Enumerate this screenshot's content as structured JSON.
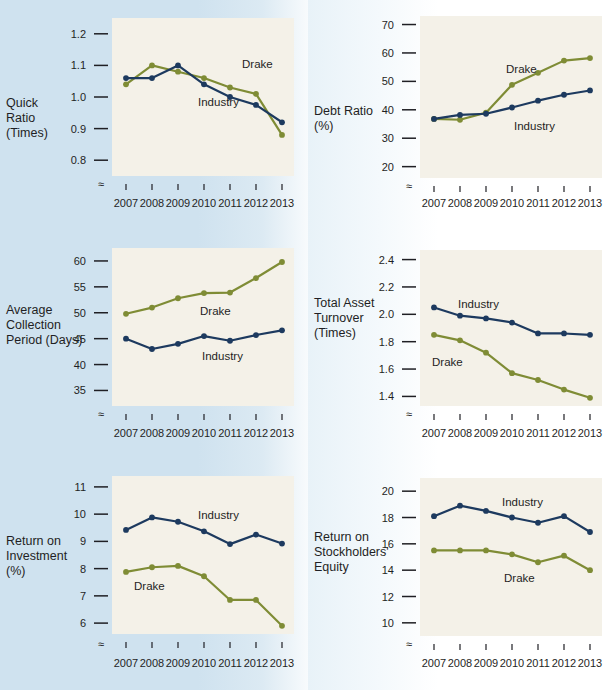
{
  "figure": {
    "years": [
      "2007",
      "2008",
      "2009",
      "2010",
      "2011",
      "2012",
      "2013"
    ],
    "series_names": {
      "industry": "Industry",
      "drake": "Drake"
    },
    "colors": {
      "industry": "#1d3a5f",
      "drake": "#7f8c35",
      "panel_bg": "#f4f1e8",
      "band_bg": "#cfe2ef",
      "text": "#1f1f24"
    },
    "axis_break_symbol": "≈"
  },
  "charts": [
    {
      "id": "quick-ratio",
      "row_label": "Quick\nRatio\n(Times)",
      "row_label_lines": [
        "Quick",
        "Ratio",
        "(Times)"
      ],
      "chart_data": {
        "type": "line",
        "title": "Quick Ratio (Times)",
        "xlabel": "",
        "ylabel": "Quick Ratio (Times)",
        "categories": [
          "2007",
          "2008",
          "2009",
          "2010",
          "2011",
          "2012",
          "2013"
        ],
        "yticks": [
          0.8,
          0.9,
          1.0,
          1.1,
          1.2
        ],
        "ytick_labels": [
          "0.8",
          "0.9",
          "1.0",
          "1.1",
          "1.2"
        ],
        "ylim": [
          0.75,
          1.25
        ],
        "grid": false,
        "legend": "inline-annotations",
        "series": [
          {
            "name": "Drake",
            "values": [
              1.04,
              1.1,
              1.08,
              1.06,
              1.03,
              1.01,
              0.88
            ]
          },
          {
            "name": "Industry",
            "values": [
              1.06,
              1.06,
              1.1,
              1.04,
              1.0,
              0.975,
              0.92
            ]
          }
        ],
        "annotations": [
          {
            "text": "Drake",
            "series": "Drake"
          },
          {
            "text": "Industry",
            "series": "Industry"
          }
        ]
      }
    },
    {
      "id": "debt-ratio",
      "row_label_lines": [
        "Debt Ratio",
        "(%)"
      ],
      "chart_data": {
        "type": "line",
        "title": "Debt Ratio (%)",
        "xlabel": "",
        "ylabel": "Debt Ratio (%)",
        "categories": [
          "2007",
          "2008",
          "2009",
          "2010",
          "2011",
          "2012",
          "2013"
        ],
        "yticks": [
          20,
          30,
          40,
          50,
          60,
          70
        ],
        "ytick_labels": [
          "20",
          "30",
          "40",
          "50",
          "60",
          "70"
        ],
        "ylim": [
          16,
          73
        ],
        "grid": false,
        "legend": "inline-annotations",
        "series": [
          {
            "name": "Drake",
            "values": [
              36.8,
              36.5,
              39.0,
              48.8,
              53.0,
              57.3,
              58.2
            ]
          },
          {
            "name": "Industry",
            "values": [
              36.8,
              38.2,
              38.6,
              40.8,
              43.2,
              45.3,
              46.8
            ]
          }
        ],
        "annotations": [
          {
            "text": "Drake",
            "series": "Drake"
          },
          {
            "text": "Industry",
            "series": "Industry"
          }
        ]
      }
    },
    {
      "id": "average-collection-period",
      "row_label_lines": [
        "Average",
        "Collection",
        "Period (Days)"
      ],
      "chart_data": {
        "type": "line",
        "title": "Average Collection Period (Days)",
        "xlabel": "",
        "ylabel": "Average Collection Period (Days)",
        "categories": [
          "2007",
          "2008",
          "2009",
          "2010",
          "2011",
          "2012",
          "2013"
        ],
        "yticks": [
          35,
          40,
          45,
          50,
          55,
          60
        ],
        "ytick_labels": [
          "35",
          "40",
          "45",
          "50",
          "55",
          "60"
        ],
        "ylim": [
          32,
          62.5
        ],
        "grid": false,
        "legend": "inline-annotations",
        "series": [
          {
            "name": "Drake",
            "values": [
              49.8,
              51.0,
              52.8,
              53.8,
              53.9,
              56.7,
              59.8
            ]
          },
          {
            "name": "Industry",
            "values": [
              45.0,
              43.0,
              44.0,
              45.5,
              44.6,
              45.7,
              46.6
            ]
          }
        ],
        "annotations": [
          {
            "text": "Drake",
            "series": "Drake"
          },
          {
            "text": "Industry",
            "series": "Industry"
          }
        ]
      }
    },
    {
      "id": "total-asset-turnover",
      "row_label_lines": [
        "Total Asset",
        "Turnover",
        "(Times)"
      ],
      "chart_data": {
        "type": "line",
        "title": "Total Asset Turnover (Times)",
        "xlabel": "",
        "ylabel": "Total Asset Turnover (Times)",
        "categories": [
          "2007",
          "2008",
          "2009",
          "2010",
          "2011",
          "2012",
          "2013"
        ],
        "yticks": [
          1.4,
          1.6,
          1.8,
          2.0,
          2.2,
          2.4
        ],
        "ytick_labels": [
          "1.4",
          "1.6",
          "1.8",
          "2.0",
          "2.2",
          "2.4"
        ],
        "ylim": [
          1.33,
          2.47
        ],
        "grid": false,
        "legend": "inline-annotations",
        "series": [
          {
            "name": "Industry",
            "values": [
              2.05,
              1.99,
              1.97,
              1.94,
              1.86,
              1.86,
              1.85
            ]
          },
          {
            "name": "Drake",
            "values": [
              1.85,
              1.81,
              1.72,
              1.57,
              1.52,
              1.45,
              1.39
            ]
          }
        ],
        "annotations": [
          {
            "text": "Industry",
            "series": "Industry"
          },
          {
            "text": "Drake",
            "series": "Drake"
          }
        ]
      }
    },
    {
      "id": "return-on-investment",
      "row_label_lines": [
        "Return on",
        "Investment",
        "(%)"
      ],
      "chart_data": {
        "type": "line",
        "title": "Return on Investment (%)",
        "xlabel": "",
        "ylabel": "Return on Investment (%)",
        "categories": [
          "2007",
          "2008",
          "2009",
          "2010",
          "2011",
          "2012",
          "2013"
        ],
        "yticks": [
          6,
          7,
          8,
          9,
          10,
          11
        ],
        "ytick_labels": [
          "6",
          "7",
          "8",
          "9",
          "10",
          "11"
        ],
        "ylim": [
          5.6,
          11.4
        ],
        "grid": false,
        "legend": "inline-annotations",
        "series": [
          {
            "name": "Industry",
            "values": [
              9.42,
              9.88,
              9.72,
              9.37,
              8.9,
              9.25,
              8.92
            ]
          },
          {
            "name": "Drake",
            "values": [
              7.88,
              8.05,
              8.1,
              7.72,
              6.85,
              6.85,
              5.9
            ]
          }
        ],
        "annotations": [
          {
            "text": "Industry",
            "series": "Industry"
          },
          {
            "text": "Drake",
            "series": "Drake"
          }
        ]
      }
    },
    {
      "id": "return-on-stockholders-equity",
      "row_label_lines": [
        "Return on",
        "Stockholders'",
        "Equity"
      ],
      "chart_data": {
        "type": "line",
        "title": "Return on Stockholders' Equity (%)",
        "xlabel": "",
        "ylabel": "Return on Stockholders' Equity",
        "categories": [
          "2007",
          "2008",
          "2009",
          "2010",
          "2011",
          "2012",
          "2013"
        ],
        "yticks": [
          10,
          12,
          14,
          16,
          18,
          20
        ],
        "ytick_labels": [
          "10",
          "12",
          "14",
          "16",
          "18",
          "20"
        ],
        "ylim": [
          9,
          21
        ],
        "grid": false,
        "legend": "inline-annotations",
        "series": [
          {
            "name": "Industry",
            "values": [
              18.1,
              18.9,
              18.5,
              18.0,
              17.6,
              18.1,
              16.9
            ]
          },
          {
            "name": "Drake",
            "values": [
              15.5,
              15.5,
              15.5,
              15.2,
              14.6,
              15.1,
              14.0
            ]
          }
        ],
        "annotations": [
          {
            "text": "Industry",
            "series": "Industry"
          },
          {
            "text": "Drake",
            "series": "Drake"
          }
        ]
      }
    }
  ]
}
